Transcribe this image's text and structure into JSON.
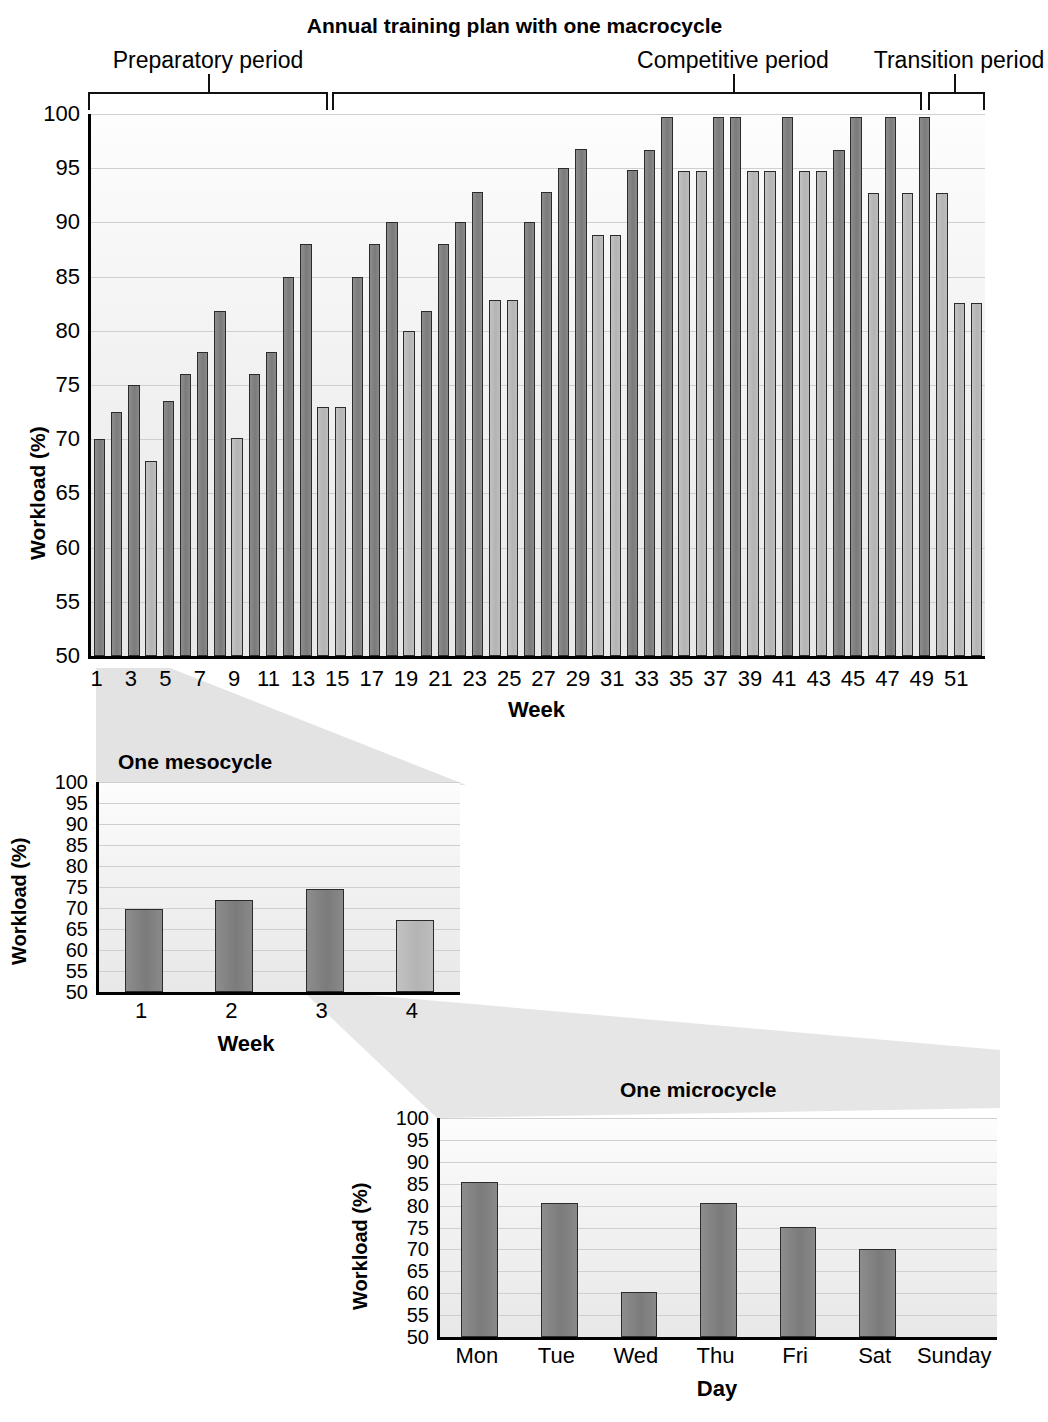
{
  "main": {
    "title": "Annual training plan with one macrocycle",
    "ylabel": "Workload (%)",
    "xlabel": "Week",
    "periods": [
      {
        "label": "Preparatory period"
      },
      {
        "label": "Competitive period"
      },
      {
        "label": "Transition period"
      }
    ]
  },
  "meso": {
    "title": "One mesocycle",
    "ylabel": "Workload (%)",
    "xlabel": "Week"
  },
  "micro": {
    "title": "One microcycle",
    "ylabel": "Workload (%)",
    "xlabel": "Day"
  },
  "chart_data": [
    {
      "type": "bar",
      "id": "macrocycle",
      "title": "Annual training plan with one macrocycle",
      "xlabel": "Week",
      "ylabel": "Workload (%)",
      "ylim": [
        50,
        100
      ],
      "yticks": [
        50,
        55,
        60,
        65,
        70,
        75,
        80,
        85,
        90,
        95,
        100
      ],
      "grid": true,
      "legend": "none",
      "categories": [
        1,
        2,
        3,
        4,
        5,
        6,
        7,
        8,
        9,
        10,
        11,
        12,
        13,
        14,
        15,
        16,
        17,
        18,
        19,
        20,
        21,
        22,
        23,
        24,
        25,
        26,
        27,
        28,
        29,
        30,
        31,
        32,
        33,
        34,
        35,
        36,
        37,
        38,
        39,
        40,
        41,
        42,
        43,
        44,
        45,
        46,
        47,
        48,
        49,
        50,
        51,
        52
      ],
      "xtick_labels": [
        "1",
        "3",
        "5",
        "7",
        "9",
        "11",
        "13",
        "15",
        "17",
        "19",
        "21",
        "23",
        "25",
        "27",
        "29",
        "31",
        "33",
        "35",
        "37",
        "39",
        "41",
        "43",
        "45",
        "47",
        "49",
        "51"
      ],
      "values": [
        70.0,
        72.5,
        75.0,
        68.0,
        73.5,
        76.0,
        78.0,
        81.8,
        70.1,
        76.0,
        78.0,
        85.0,
        88.0,
        73.0,
        73.0,
        85.0,
        88.0,
        90.0,
        80.0,
        81.8,
        88.0,
        90.0,
        92.8,
        82.8,
        82.8,
        90.0,
        92.8,
        95.0,
        96.8,
        88.8,
        88.8,
        94.8,
        96.7,
        99.7,
        94.7,
        94.7,
        99.7,
        99.7,
        94.7,
        94.7,
        99.7,
        94.7,
        94.7,
        96.7,
        99.7,
        92.7,
        99.7,
        92.7,
        99.7,
        92.7,
        82.6,
        82.6
      ],
      "bar_shades": [
        "dark",
        "dark",
        "dark",
        "light",
        "dark",
        "dark",
        "dark",
        "dark",
        "light",
        "dark",
        "dark",
        "dark",
        "dark",
        "light",
        "light",
        "dark",
        "dark",
        "dark",
        "light",
        "dark",
        "dark",
        "dark",
        "dark",
        "light",
        "light",
        "dark",
        "dark",
        "dark",
        "dark",
        "light",
        "light",
        "dark",
        "dark",
        "dark",
        "light",
        "light",
        "dark",
        "dark",
        "light",
        "light",
        "dark",
        "light",
        "light",
        "dark",
        "dark",
        "light",
        "dark",
        "light",
        "dark",
        "light",
        "light",
        "light"
      ],
      "annotations": [
        {
          "text": "Preparatory period",
          "span_weeks": [
            1,
            26
          ]
        },
        {
          "text": "Competitive period",
          "span_weeks": [
            27,
            48
          ]
        },
        {
          "text": "Transition period",
          "span_weeks": [
            49,
            52
          ]
        }
      ]
    },
    {
      "type": "bar",
      "id": "mesocycle",
      "title": "One mesocycle",
      "xlabel": "Week",
      "ylabel": "Workload (%)",
      "ylim": [
        50,
        100
      ],
      "yticks": [
        50,
        55,
        60,
        65,
        70,
        75,
        80,
        85,
        90,
        95,
        100
      ],
      "grid": true,
      "legend": "none",
      "categories": [
        "1",
        "2",
        "3",
        "4"
      ],
      "values": [
        69.8,
        71.8,
        74.5,
        67.2
      ],
      "bar_shades": [
        "dark",
        "dark",
        "dark",
        "light"
      ]
    },
    {
      "type": "bar",
      "id": "microcycle",
      "title": "One microcycle",
      "xlabel": "Day",
      "ylabel": "Workload (%)",
      "ylim": [
        50,
        100
      ],
      "yticks": [
        50,
        55,
        60,
        65,
        70,
        75,
        80,
        85,
        90,
        95,
        100
      ],
      "grid": true,
      "legend": "none",
      "categories": [
        "Mon",
        "Tue",
        "Wed",
        "Thu",
        "Fri",
        "Sat",
        "Sunday"
      ],
      "values": [
        85.5,
        80.5,
        60.2,
        80.5,
        75.2,
        70.2,
        0
      ],
      "bar_shades": [
        "dark",
        "dark",
        "dark",
        "dark",
        "dark",
        "dark",
        "none"
      ]
    }
  ]
}
